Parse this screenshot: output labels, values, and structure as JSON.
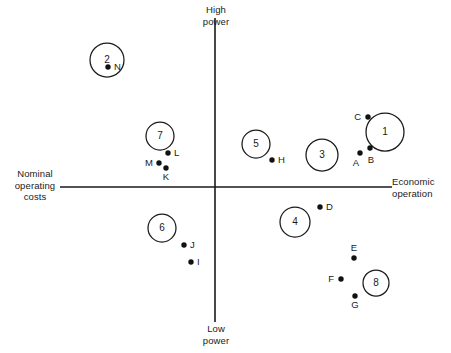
{
  "chart_data": {
    "type": "scatter",
    "title": "",
    "subtitle": "",
    "xlabel": "Economic operation",
    "ylabel": "High power",
    "xlabel_left": "Nominal operating costs",
    "ylabel_bottom": "Low power",
    "grid": false,
    "legend": "none",
    "axes": {
      "origin_x": 215,
      "origin_y": 187,
      "x_axis_from": 60,
      "x_axis_to": 392,
      "y_axis_from": 18,
      "y_axis_to": 322,
      "xlim": [
        -155,
        177
      ],
      "ylim": [
        -135,
        169
      ]
    },
    "axis_labels": {
      "top": "High\npower",
      "bottom": "Low\npower",
      "left": "Nominal\noperating\ncosts",
      "right": "Economic\noperation"
    },
    "groups": [
      {
        "label": "1",
        "cx": 385,
        "cy": 132,
        "r": 19,
        "x": 170,
        "y": 55
      },
      {
        "label": "2",
        "cx": 107,
        "cy": 60,
        "r": 17,
        "x": -108,
        "y": 127
      },
      {
        "label": "3",
        "cx": 322,
        "cy": 155,
        "r": 16,
        "x": 107,
        "y": 32
      },
      {
        "label": "4",
        "cx": 295,
        "cy": 222,
        "r": 15,
        "x": 80,
        "y": -35
      },
      {
        "label": "5",
        "cx": 256,
        "cy": 144,
        "r": 14,
        "x": 41,
        "y": 43
      },
      {
        "label": "6",
        "cx": 162,
        "cy": 228,
        "r": 14,
        "x": -53,
        "y": -41
      },
      {
        "label": "7",
        "cx": 160,
        "cy": 136,
        "r": 14,
        "x": -55,
        "y": 51
      },
      {
        "label": "8",
        "cx": 376,
        "cy": 283,
        "r": 13,
        "x": 161,
        "y": -96
      }
    ],
    "points": [
      {
        "label": "A",
        "px": 360,
        "py": 153,
        "x": 145,
        "y": 34,
        "label_dx": -4,
        "label_dy": 13,
        "anchor": "middle"
      },
      {
        "label": "B",
        "px": 370,
        "py": 148,
        "x": 155,
        "y": 39,
        "label_dx": 1,
        "label_dy": 15,
        "anchor": "middle"
      },
      {
        "label": "C",
        "px": 368,
        "py": 117,
        "x": 153,
        "y": 70,
        "label_dx": -7,
        "label_dy": 3,
        "anchor": "end"
      },
      {
        "label": "D",
        "px": 320,
        "py": 207,
        "x": 105,
        "y": -20,
        "label_dx": 6,
        "label_dy": 3,
        "anchor": "start"
      },
      {
        "label": "E",
        "px": 354,
        "py": 258,
        "x": 139,
        "y": -71,
        "label_dx": 0,
        "label_dy": -7,
        "anchor": "middle"
      },
      {
        "label": "F",
        "px": 341,
        "py": 279,
        "x": 126,
        "y": -92,
        "label_dx": -7,
        "label_dy": 3,
        "anchor": "end"
      },
      {
        "label": "G",
        "px": 355,
        "py": 296,
        "x": 140,
        "y": -109,
        "label_dx": 0,
        "label_dy": 12,
        "anchor": "middle"
      },
      {
        "label": "H",
        "px": 272,
        "py": 160,
        "x": 57,
        "y": 27,
        "label_dx": 6,
        "label_dy": 3,
        "anchor": "start"
      },
      {
        "label": "I",
        "px": 191,
        "py": 262,
        "x": -24,
        "y": -75,
        "label_dx": 6,
        "label_dy": 3,
        "anchor": "start"
      },
      {
        "label": "J",
        "px": 184,
        "py": 245,
        "x": -31,
        "y": -58,
        "label_dx": 6,
        "label_dy": 3,
        "anchor": "start"
      },
      {
        "label": "K",
        "px": 166,
        "py": 168,
        "x": -49,
        "y": 19,
        "label_dx": 0,
        "label_dy": 12,
        "anchor": "middle"
      },
      {
        "label": "L",
        "px": 168,
        "py": 153,
        "x": -47,
        "y": 34,
        "label_dx": 6,
        "label_dy": 3,
        "anchor": "start"
      },
      {
        "label": "M",
        "px": 159,
        "py": 163,
        "x": -56,
        "y": 24,
        "label_dx": -6,
        "label_dy": 3,
        "anchor": "end"
      },
      {
        "label": "N",
        "px": 108,
        "py": 67,
        "x": -107,
        "y": 120,
        "label_dx": 6,
        "label_dy": 3,
        "anchor": "start"
      }
    ]
  }
}
